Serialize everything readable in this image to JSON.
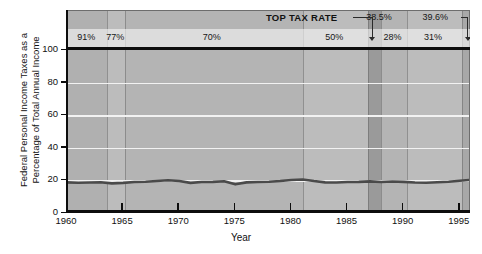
{
  "chart_data": {
    "type": "line",
    "title": "",
    "xlabel": "Year",
    "ylabel": "Federal Personal Income Taxes as a Percentage of Total Annual Income",
    "ylabel_lines": [
      "Federal Personal Income Taxes as a",
      "Percentage of Total Annual Income"
    ],
    "xlim": [
      1960,
      1996
    ],
    "ylim": [
      0,
      124
    ],
    "yticks": [
      0,
      20,
      40,
      60,
      80,
      100
    ],
    "xticks": [
      1960,
      1965,
      1970,
      1975,
      1980,
      1985,
      1990,
      1995
    ],
    "grid": "horizontal-white-gridlines",
    "legend": "none",
    "header_title": "TOP TAX RATE",
    "series": [
      {
        "name": "Federal personal income taxes as % of total annual income",
        "color": "#4a4a4a",
        "x": [
          1960,
          1961,
          1962,
          1963,
          1964,
          1965,
          1966,
          1967,
          1968,
          1969,
          1970,
          1971,
          1972,
          1973,
          1974,
          1975,
          1976,
          1977,
          1978,
          1979,
          1980,
          1981,
          1982,
          1983,
          1984,
          1985,
          1986,
          1987,
          1988,
          1989,
          1990,
          1991,
          1992,
          1993,
          1994,
          1995,
          1996
        ],
        "values": [
          18.8,
          18.6,
          18.7,
          18.9,
          18.2,
          18.5,
          19.0,
          19.2,
          19.6,
          20.1,
          19.6,
          18.5,
          19.0,
          19.1,
          19.5,
          17.6,
          18.8,
          19.0,
          19.2,
          19.6,
          20.3,
          20.6,
          19.6,
          18.8,
          18.7,
          19.0,
          19.1,
          19.4,
          19.0,
          19.3,
          19.1,
          18.7,
          18.6,
          18.9,
          19.2,
          19.8,
          20.4
        ]
      }
    ],
    "tax_bands": [
      {
        "label": "91%",
        "start": 1960,
        "end": 1963.6,
        "shade": "#b0b0b0",
        "label_x": 1961.8
      },
      {
        "label": "77%",
        "start": 1963.6,
        "end": 1965.2,
        "shade": "#bcbcbc",
        "label_x": 1964.4
      },
      {
        "label": "70%",
        "start": 1965.2,
        "end": 1981.0,
        "shade": "#b4b4b4",
        "label_x": 1973.0
      },
      {
        "label": "50%",
        "start": 1981.0,
        "end": 1986.8,
        "shade": "#bcbcbc",
        "label_x": 1983.9
      },
      {
        "label": "38.5%",
        "start": 1986.8,
        "end": 1988.0,
        "shade": "#9a9a9a",
        "label_x": 1987.4,
        "callout": true
      },
      {
        "label": "28%",
        "start": 1988.0,
        "end": 1990.3,
        "shade": "#b4b4b4",
        "label_x": 1989.1
      },
      {
        "label": "31%",
        "start": 1990.3,
        "end": 1995.2,
        "shade": "#bcbcbc",
        "label_x": 1992.7
      },
      {
        "label": "39.6%",
        "start": 1995.2,
        "end": 1996.0,
        "shade": "#a8a8a8",
        "label_x": 1995.6,
        "callout": true
      }
    ],
    "callouts": [
      {
        "label": "38.5%",
        "target_year": 1987.3
      },
      {
        "label": "39.6%",
        "target_year": 1995.6
      }
    ]
  },
  "colors": {
    "axis": "#0d0d0d",
    "gridline": "#f2f2f2",
    "line": "#4a4a4a",
    "plot_background": "#b5b5b5"
  }
}
